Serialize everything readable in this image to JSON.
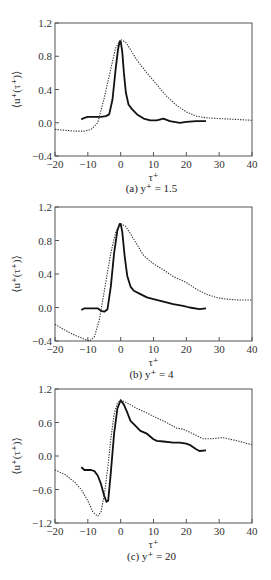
{
  "chart_data": [
    {
      "type": "line",
      "caption": "(a) y⁺ = 1.5",
      "xlabel": "τ⁺",
      "ylabel": "⟨u⁺(τ⁺)⟩",
      "xlim": [
        -20,
        40
      ],
      "ylim": [
        -0.4,
        1.2
      ],
      "xticks": [
        -20,
        -10,
        0,
        10,
        20,
        30,
        40
      ],
      "yticks": [
        -0.4,
        0.0,
        0.4,
        0.8,
        1.2
      ],
      "ytick_labels": [
        "−0.4",
        "0.0",
        "0.4",
        "0.8",
        "1.2"
      ],
      "box": {
        "left": 55,
        "top": 23,
        "right": 252,
        "bottom": 156
      },
      "caption_y": 192,
      "series": [
        {
          "name": "solid",
          "style": "solid",
          "x": [
            -12,
            -11,
            -10,
            -8,
            -6,
            -4.5,
            -3.5,
            -2.5,
            -1.5,
            -0.8,
            -0.3,
            0,
            0.5,
            1,
            1.6,
            2.4,
            3.5,
            5,
            7,
            9,
            11,
            13,
            15,
            18,
            20,
            23,
            26
          ],
          "y": [
            0.04,
            0.06,
            0.07,
            0.07,
            0.07,
            0.08,
            0.1,
            0.28,
            0.65,
            0.88,
            0.98,
            0.98,
            0.85,
            0.6,
            0.36,
            0.22,
            0.16,
            0.1,
            0.05,
            0.03,
            0.03,
            0.05,
            0.02,
            0.0,
            0.01,
            0.02,
            0.02
          ]
        },
        {
          "name": "dotted",
          "style": "dotted",
          "x": [
            -20,
            -17,
            -14,
            -11,
            -9,
            -7,
            -5,
            -3,
            -1.5,
            0,
            1.5,
            3,
            5,
            8,
            11,
            14,
            17,
            20,
            23,
            26,
            30,
            35,
            40
          ],
          "y": [
            -0.08,
            -0.09,
            -0.1,
            -0.1,
            -0.08,
            0.0,
            0.3,
            0.65,
            0.9,
            1.0,
            0.97,
            0.88,
            0.75,
            0.6,
            0.46,
            0.32,
            0.21,
            0.13,
            0.08,
            0.06,
            0.05,
            0.04,
            0.03
          ]
        }
      ]
    },
    {
      "type": "line",
      "caption": "(b) y⁺ = 4",
      "xlabel": "τ⁺",
      "ylabel": "⟨u⁺(τ⁺)⟩",
      "xlim": [
        -20,
        40
      ],
      "ylim": [
        -0.4,
        1.2
      ],
      "xticks": [
        -20,
        -10,
        0,
        10,
        20,
        30,
        40
      ],
      "yticks": [
        -0.4,
        0.0,
        0.4,
        0.8,
        1.2
      ],
      "ytick_labels": [
        "−0.4",
        "0.0",
        "0.4",
        "0.8",
        "1.2"
      ],
      "box": {
        "left": 55,
        "top": 207,
        "right": 252,
        "bottom": 341
      },
      "caption_y": 378,
      "series": [
        {
          "name": "solid",
          "style": "solid",
          "x": [
            -12,
            -11,
            -9,
            -7,
            -6,
            -5,
            -4,
            -3,
            -2,
            -1,
            -0.3,
            0,
            0.5,
            1.2,
            2,
            3,
            4,
            6,
            8,
            10,
            13,
            16,
            19,
            21,
            24,
            26
          ],
          "y": [
            -0.03,
            -0.01,
            -0.01,
            -0.01,
            -0.04,
            -0.05,
            -0.02,
            0.25,
            0.65,
            0.92,
            1.0,
            1.0,
            0.9,
            0.62,
            0.38,
            0.25,
            0.2,
            0.16,
            0.12,
            0.1,
            0.07,
            0.04,
            0.02,
            0.0,
            -0.02,
            -0.01
          ]
        },
        {
          "name": "dotted",
          "style": "dotted",
          "x": [
            -20,
            -17,
            -14,
            -11,
            -9.5,
            -8,
            -6.5,
            -5,
            -3,
            -1.5,
            0,
            1.5,
            3,
            5,
            7,
            10,
            13,
            16,
            20,
            23,
            26,
            29,
            32,
            36,
            40
          ],
          "y": [
            -0.2,
            -0.27,
            -0.33,
            -0.38,
            -0.4,
            -0.35,
            -0.15,
            0.2,
            0.65,
            0.9,
            1.0,
            0.97,
            0.88,
            0.75,
            0.62,
            0.52,
            0.45,
            0.37,
            0.3,
            0.22,
            0.16,
            0.12,
            0.1,
            0.09,
            0.09
          ]
        }
      ]
    },
    {
      "type": "line",
      "caption": "(c) y⁺ = 20",
      "xlabel": "τ⁺",
      "ylabel": "⟨u⁺(τ⁺)⟩",
      "xlim": [
        -20,
        40
      ],
      "ylim": [
        -1.2,
        1.2
      ],
      "xticks": [
        -20,
        -10,
        0,
        10,
        20,
        30,
        40
      ],
      "yticks": [
        -1.2,
        -0.6,
        0.0,
        0.6,
        1.2
      ],
      "ytick_labels": [
        "−1.2",
        "−0.6",
        "0.0",
        "0.6",
        "1.2"
      ],
      "box": {
        "left": 55,
        "top": 389,
        "right": 252,
        "bottom": 523
      },
      "caption_y": 560,
      "series": [
        {
          "name": "solid",
          "style": "solid",
          "x": [
            -12,
            -11,
            -9,
            -8,
            -7,
            -6,
            -5,
            -4.3,
            -3.8,
            -3,
            -2,
            -1,
            0,
            1,
            2,
            3,
            4,
            6,
            8,
            9,
            10,
            11,
            13,
            16,
            18,
            20,
            21,
            22,
            23,
            24,
            26
          ],
          "y": [
            -0.2,
            -0.25,
            -0.25,
            -0.27,
            -0.35,
            -0.5,
            -0.72,
            -0.82,
            -0.8,
            -0.3,
            0.4,
            0.85,
            1.0,
            0.92,
            0.78,
            0.63,
            0.57,
            0.45,
            0.4,
            0.35,
            0.3,
            0.27,
            0.26,
            0.24,
            0.24,
            0.22,
            0.2,
            0.16,
            0.12,
            0.09,
            0.1
          ]
        },
        {
          "name": "dotted",
          "style": "dotted",
          "x": [
            -20,
            -17,
            -14,
            -12,
            -10,
            -8.5,
            -7,
            -6,
            -5,
            -4,
            -3,
            -2,
            -1,
            0,
            2,
            5,
            8,
            11,
            14,
            17,
            19,
            22,
            25,
            28,
            31,
            35,
            40
          ],
          "y": [
            -0.25,
            -0.33,
            -0.47,
            -0.6,
            -0.8,
            -1.0,
            -1.08,
            -1.0,
            -0.7,
            -0.25,
            0.3,
            0.75,
            0.95,
            1.0,
            0.95,
            0.85,
            0.77,
            0.68,
            0.6,
            0.5,
            0.48,
            0.4,
            0.31,
            0.31,
            0.33,
            0.28,
            0.2
          ]
        }
      ]
    }
  ]
}
